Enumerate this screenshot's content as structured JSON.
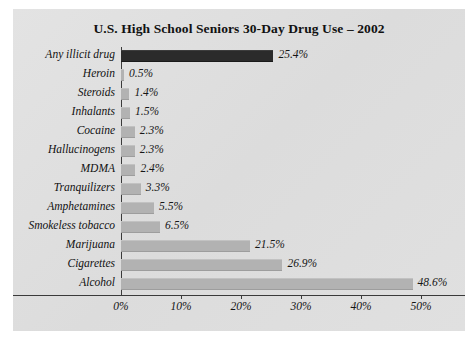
{
  "chart_data": {
    "type": "bar",
    "orientation": "horizontal",
    "title": "U.S. High School Seniors 30-Day Drug Use – 2002",
    "xlabel": "",
    "ylabel": "",
    "xlim": [
      0,
      55
    ],
    "grid": false,
    "legend": null,
    "xticks": [
      "0%",
      "10%",
      "20%",
      "30%",
      "40%",
      "50%"
    ],
    "xtick_values": [
      0,
      10,
      20,
      30,
      40,
      50
    ],
    "categories": [
      "Any illicit drug",
      "Heroin",
      "Steroids",
      "Inhalants",
      "Cocaine",
      "Hallucinogens",
      "MDMA",
      "Tranquilizers",
      "Amphetamines",
      "Smokeless tobacco",
      "Marijuana",
      "Cigarettes",
      "Alcohol"
    ],
    "values": [
      25.4,
      0.5,
      1.4,
      1.5,
      2.3,
      2.3,
      2.4,
      3.3,
      5.5,
      6.5,
      21.5,
      26.9,
      48.6
    ],
    "value_labels": [
      "25.4%",
      "0.5%",
      "1.4%",
      "1.5%",
      "2.3%",
      "2.3%",
      "2.4%",
      "3.3%",
      "5.5%",
      "6.5%",
      "21.5%",
      "26.9%",
      "48.6%"
    ],
    "highlight_index": 0,
    "colors": {
      "bar": "#b2b2b2",
      "bar_highlight": "#2b2b2b",
      "figure_background": "#dfdfdf",
      "axis": "#3a3a3a",
      "text": "#111111"
    }
  }
}
